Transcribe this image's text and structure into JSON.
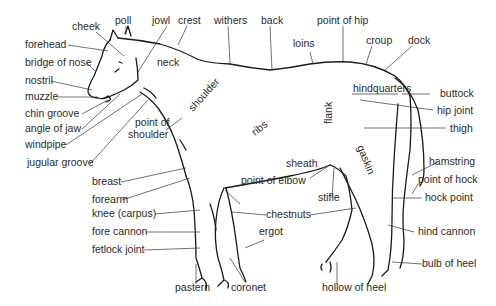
{
  "diagram": {
    "labels": {
      "poll": "poll",
      "jowl": "jowl",
      "crest": "crest",
      "withers": "withers",
      "back": "back",
      "point_of_hip": "point of hip",
      "cheek": "cheek",
      "loins": "loins",
      "croup": "croup",
      "dock": "dock",
      "forehead": "forehead",
      "bridge_of_nose": "bridge of nose",
      "neck": "neck",
      "nostril": "nostril",
      "muzzle": "muzzle",
      "chin_groove": "chin groove",
      "angle_of_jaw": "angle of jaw",
      "windpipe": "windpipe",
      "jugular_groove": "jugular groove",
      "point_of_shoulder_1": "point of",
      "point_of_shoulder_2": "shoulder",
      "shoulder": "shoulder",
      "ribs": "ribs",
      "flank": "flank",
      "hindquarters": "hindquarters",
      "buttock": "buttock",
      "hip_joint": "hip joint",
      "thigh": "thigh",
      "gaskin": "gaskin",
      "sheath": "sheath",
      "hamstring": "hamstring",
      "point_of_hock": "point of hock",
      "hock_point": "hock point",
      "breast": "breast",
      "forearm": "forearm",
      "point_of_elbow": "point of elbow",
      "stifle": "stifle",
      "knee": "knee (carpus)",
      "chestnuts": "chestnuts",
      "fore_cannon": "fore cannon",
      "ergot": "ergot",
      "fetlock_joint": "fetlock joint",
      "hind_cannon": "hind cannon",
      "bulb_of_heel": "bulb of heel",
      "pastern": "pastern",
      "coronet": "coronet",
      "hollow_of_heel": "hollow of heel"
    }
  }
}
